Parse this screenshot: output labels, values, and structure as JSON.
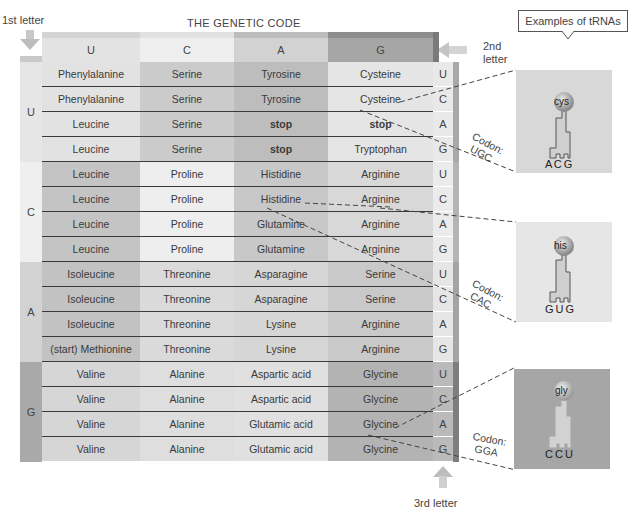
{
  "title": "THE GENETIC CODE",
  "axis_labels": {
    "first": "1st letter",
    "second": "2nd letter",
    "second_line1": "2nd",
    "second_line2": "letter",
    "third": "3rd letter"
  },
  "second_letters": [
    "U",
    "C",
    "A",
    "G"
  ],
  "first_letters": [
    "U",
    "C",
    "A",
    "G"
  ],
  "third_letters": [
    "U",
    "C",
    "A",
    "G"
  ],
  "colors": {
    "U_light": "#e4e4e4",
    "C_light": "#efefef",
    "A_mid": "#cfcfcf",
    "G_dark": "#a9a9a9",
    "cell_dark": "#bdbdbd",
    "cell_mid": "#cacaca",
    "cell_light": "#dedede",
    "cell_lighter": "#ececec"
  },
  "groups": [
    {
      "first": "U",
      "rows": [
        {
          "third": "U",
          "cells": [
            "Phenylalanine",
            "Serine",
            "Tyrosine",
            "Cysteine"
          ]
        },
        {
          "third": "C",
          "cells": [
            "Phenylalanine",
            "Serine",
            "Tyrosine",
            "Cysteine"
          ]
        },
        {
          "third": "A",
          "cells": [
            "Leucine",
            "Serine",
            "stop",
            "stop"
          ]
        },
        {
          "third": "G",
          "cells": [
            "Leucine",
            "Serine",
            "stop",
            "Tryptophan"
          ]
        }
      ]
    },
    {
      "first": "C",
      "rows": [
        {
          "third": "U",
          "cells": [
            "Leucine",
            "Proline",
            "Histidine",
            "Arginine"
          ]
        },
        {
          "third": "C",
          "cells": [
            "Leucine",
            "Proline",
            "Histidine",
            "Arginine"
          ]
        },
        {
          "third": "A",
          "cells": [
            "Leucine",
            "Proline",
            "Glutamine",
            "Arginine"
          ]
        },
        {
          "third": "G",
          "cells": [
            "Leucine",
            "Proline",
            "Glutamine",
            "Arginine"
          ]
        }
      ]
    },
    {
      "first": "A",
      "rows": [
        {
          "third": "U",
          "cells": [
            "Isoleucine",
            "Threonine",
            "Asparagine",
            "Serine"
          ]
        },
        {
          "third": "C",
          "cells": [
            "Isoleucine",
            "Threonine",
            "Asparagine",
            "Serine"
          ]
        },
        {
          "third": "A",
          "cells": [
            "Isoleucine",
            "Threonine",
            "Lysine",
            "Arginine"
          ]
        },
        {
          "third": "G",
          "cells": [
            "(start) Methionine",
            "Threonine",
            "Lysine",
            "Arginine"
          ]
        }
      ]
    },
    {
      "first": "G",
      "rows": [
        {
          "third": "U",
          "cells": [
            "Valine",
            "Alanine",
            "Aspartic acid",
            "Glycine"
          ]
        },
        {
          "third": "C",
          "cells": [
            "Valine",
            "Alanine",
            "Aspartic acid",
            "Glycine"
          ]
        },
        {
          "third": "A",
          "cells": [
            "Valine",
            "Alanine",
            "Glutamic acid",
            "Glycine"
          ]
        },
        {
          "third": "G",
          "cells": [
            "Valine",
            "Alanine",
            "Glutamic acid",
            "Glycine"
          ]
        }
      ]
    }
  ],
  "trna_examples": {
    "heading": "Examples of tRNAs",
    "items": [
      {
        "amino": "cys",
        "anticodon": "A C G",
        "codon_label": "Codon:",
        "codon": "UGC"
      },
      {
        "amino": "his",
        "anticodon": "G U G",
        "codon_label": "Codon:",
        "codon": "CAC"
      },
      {
        "amino": "gly",
        "anticodon": "C C U",
        "codon_label": "Codon:",
        "codon": "GGA"
      }
    ]
  }
}
